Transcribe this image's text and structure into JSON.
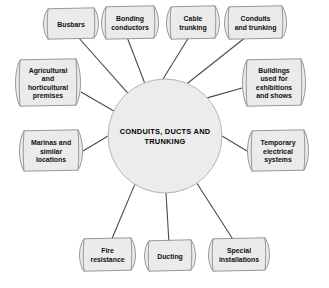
{
  "diagram": {
    "type": "mind-map-spoke",
    "background_color": "#ffffff",
    "node_fill_color": "#ebebeb",
    "node_border_color": "#8d8d8d",
    "hub_fill_color": "#ececec",
    "hub_border_color": "#b4b4b4",
    "line_color": "#4a4a4a",
    "hub": {
      "label": "CONDUITS, DUCTS AND TRUNKING",
      "lines": [
        "CONDUITS, DUCTS AND",
        "TRUNKING"
      ],
      "cx": 165,
      "cy": 136,
      "r": 57
    },
    "nodes": [
      {
        "id": "busbars",
        "label": "Busbars",
        "lines": [
          "Busbars"
        ],
        "x": 43,
        "y": 11,
        "w": 56,
        "h": 26,
        "anchor_x": 78,
        "anchor_y": 37,
        "hub_angle": 229
      },
      {
        "id": "bonding-conductors",
        "label": "Bonding conductors",
        "lines": [
          "Bonding",
          "conductors"
        ],
        "x": 101,
        "y": 9,
        "w": 58,
        "h": 28,
        "anchor_x": 127,
        "anchor_y": 37,
        "hub_angle": 249
      },
      {
        "id": "cable-trunking",
        "label": "Cable trunking",
        "lines": [
          "Cable",
          "trunking"
        ],
        "x": 166,
        "y": 9,
        "w": 54,
        "h": 28,
        "anchor_x": 189,
        "anchor_y": 37,
        "hub_angle": 268
      },
      {
        "id": "conduits-and-trunking",
        "label": "Conduits and trunking",
        "lines": [
          "Conduits",
          "and trunking"
        ],
        "x": 224,
        "y": 9,
        "w": 63,
        "h": 28,
        "anchor_x": 246,
        "anchor_y": 37,
        "hub_angle": 293
      },
      {
        "id": "buildings-exhibitions",
        "label": "Buildings used for exhibitions and shows",
        "lines": [
          "Buildings",
          "used for",
          "exhibitions",
          "and shows"
        ],
        "x": 242,
        "y": 62,
        "w": 64,
        "h": 42,
        "anchor_x": 242,
        "anchor_y": 88,
        "hub_angle": 318
      },
      {
        "id": "temporary-electrical-systems",
        "label": "Temporary electrical systems",
        "lines": [
          "Temporary",
          "electrical",
          "systems"
        ],
        "x": 247,
        "y": 133,
        "w": 62,
        "h": 36,
        "anchor_x": 247,
        "anchor_y": 151,
        "hub_angle": 0
      },
      {
        "id": "special-installations",
        "label": "Special installations",
        "lines": [
          "Special",
          "installations"
        ],
        "x": 208,
        "y": 241,
        "w": 62,
        "h": 28,
        "anchor_x": 234,
        "anchor_y": 241,
        "hub_angle": 56
      },
      {
        "id": "ducting",
        "label": "Ducting",
        "lines": [
          "Ducting"
        ],
        "x": 144,
        "y": 243,
        "w": 52,
        "h": 26,
        "anchor_x": 169,
        "anchor_y": 243,
        "hub_angle": 89
      },
      {
        "id": "fire-resistance",
        "label": "Fire resistance",
        "lines": [
          "Fire",
          "resistance"
        ],
        "x": 79,
        "y": 241,
        "w": 57,
        "h": 28,
        "anchor_x": 111,
        "anchor_y": 241,
        "hub_angle": 122
      },
      {
        "id": "marinas-similar-locations",
        "label": "Marinas and similar locations",
        "lines": [
          "Marinas and",
          "similar",
          "locations"
        ],
        "x": 19,
        "y": 133,
        "w": 64,
        "h": 36,
        "anchor_x": 83,
        "anchor_y": 151,
        "hub_angle": 180
      },
      {
        "id": "agricultural-horticultural",
        "label": "Agricultural and horticultural premises",
        "lines": [
          "Agricultural",
          "and",
          "horticultural",
          "premises"
        ],
        "x": 15,
        "y": 62,
        "w": 66,
        "h": 42,
        "anchor_x": 81,
        "anchor_y": 92,
        "hub_angle": 206
      }
    ]
  }
}
